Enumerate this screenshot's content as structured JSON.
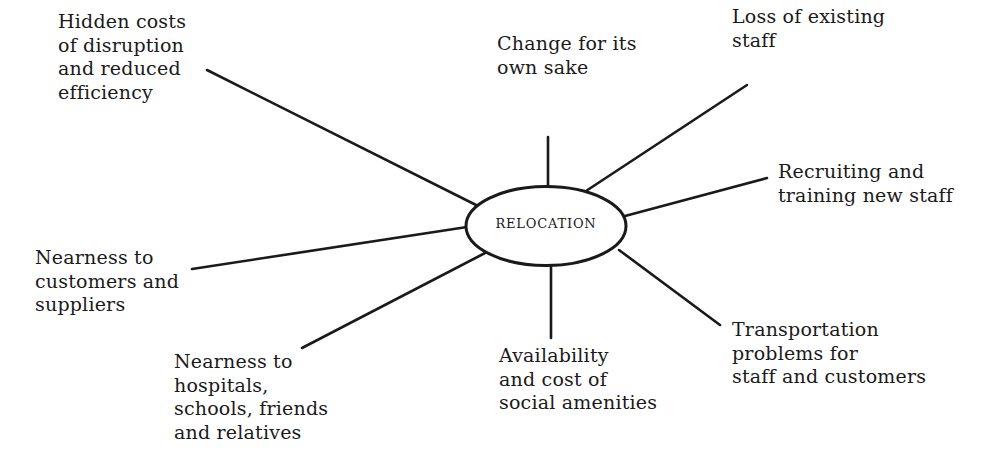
{
  "diagram": {
    "type": "spider / mind-map",
    "center": {
      "label": "RELOCATION"
    },
    "branches": [
      {
        "id": "hidden-costs",
        "lines": [
          "Hidden costs",
          "of disruption",
          "and reduced",
          "efficiency"
        ]
      },
      {
        "id": "change",
        "lines": [
          "Change for its",
          "own sake"
        ]
      },
      {
        "id": "loss-of-staff",
        "lines": [
          "Loss of existing",
          "staff"
        ]
      },
      {
        "id": "recruiting",
        "lines": [
          "Recruiting and",
          "training new staff"
        ]
      },
      {
        "id": "nearness-customers",
        "lines": [
          "Nearness to",
          "customers and",
          "suppliers"
        ]
      },
      {
        "id": "nearness-hospitals",
        "lines": [
          "Nearness to",
          "hospitals,",
          "schools, friends",
          "and relatives"
        ]
      },
      {
        "id": "availability",
        "lines": [
          "Availability",
          "and cost of",
          "social amenities"
        ]
      },
      {
        "id": "transportation",
        "lines": [
          "Transportation",
          "problems for",
          "staff and customers"
        ]
      }
    ]
  }
}
